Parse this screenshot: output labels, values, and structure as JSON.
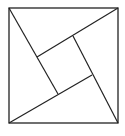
{
  "diagram": {
    "type": "geometric-figure",
    "stroke_color": "#222222",
    "background": "#ffffff",
    "outer_square": {
      "x1": 9,
      "y1": 8,
      "x2": 118,
      "y2": 123
    },
    "inner_square": [
      [
        37,
        57
      ],
      [
        73,
        36
      ],
      [
        92,
        75
      ],
      [
        58,
        94
      ]
    ],
    "lines": [
      {
        "from": [
          9,
          8
        ],
        "to": [
          58,
          94
        ]
      },
      {
        "from": [
          118,
          8
        ],
        "to": [
          37,
          57
        ]
      },
      {
        "from": [
          9,
          123
        ],
        "to": [
          92,
          75
        ]
      },
      {
        "from": [
          118,
          123
        ],
        "to": [
          73,
          36
        ]
      }
    ]
  }
}
